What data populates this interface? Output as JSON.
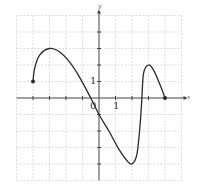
{
  "chart_data": {
    "type": "line",
    "title": "",
    "xlabel": "x",
    "ylabel": "y",
    "xlim": [
      -5,
      5
    ],
    "ylim": [
      -5,
      5
    ],
    "grid": true,
    "grid_style": "dashed",
    "tick_labels": {
      "origin": "0",
      "x_one": "1",
      "y_one": "1"
    },
    "series": [
      {
        "name": "f(x)",
        "points": [
          [
            -4,
            1
          ],
          [
            -3.9,
            1.8
          ],
          [
            -3.6,
            2.6
          ],
          [
            -3,
            3
          ],
          [
            -2.4,
            2.8
          ],
          [
            -1.8,
            2.2
          ],
          [
            -1.2,
            1.3
          ],
          [
            -0.5,
            0
          ],
          [
            0,
            -1
          ],
          [
            0.6,
            -2
          ],
          [
            1.2,
            -3.1
          ],
          [
            1.7,
            -3.8
          ],
          [
            2,
            -4
          ],
          [
            2.3,
            -3.4
          ],
          [
            2.5,
            -1.5
          ],
          [
            2.6,
            0
          ],
          [
            2.7,
            1.5
          ],
          [
            3,
            2
          ],
          [
            3.3,
            1.7
          ],
          [
            3.7,
            0.8
          ],
          [
            4,
            0
          ]
        ],
        "endpoints": [
          [
            -4,
            1
          ],
          [
            4,
            0
          ]
        ]
      }
    ],
    "colors": {
      "curve": "#2a2a2a",
      "axis": "#444444",
      "grid": "#c8c8c8"
    }
  }
}
